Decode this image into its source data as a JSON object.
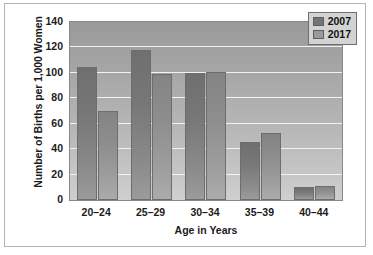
{
  "chart_data": {
    "type": "bar",
    "title": "",
    "xlabel": "Age in Years",
    "ylabel": "Number of Births per 1,000 Women",
    "categories": [
      "20–24",
      "25–29",
      "30–34",
      "35–39",
      "40–44"
    ],
    "series": [
      {
        "name": "2007",
        "values": [
          105,
          118,
          100,
          46,
          10
        ],
        "color": "#747474"
      },
      {
        "name": "2017",
        "values": [
          70,
          99,
          101,
          53,
          11
        ],
        "color": "#9a9a9a"
      }
    ],
    "ylim": [
      0,
      140
    ],
    "yticks": [
      0,
      20,
      40,
      60,
      80,
      100,
      120,
      140
    ],
    "ytick_labels": [
      "0",
      "20",
      "40",
      "60",
      "80",
      "100",
      "120",
      "140"
    ],
    "grid": true,
    "grid_color": "#f2f2f2",
    "legend_position": "top-right",
    "plot_background": "gray-gradient",
    "frame_border_color": "#b4b4b4"
  },
  "legend": {
    "entries": [
      {
        "label": "2007"
      },
      {
        "label": "2017"
      }
    ]
  }
}
